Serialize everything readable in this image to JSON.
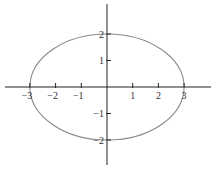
{
  "chart_data": {
    "type": "line",
    "title": "",
    "xlabel": "",
    "ylabel": "",
    "equation": "x^2/9 + y^2/4 = 1",
    "center": [
      0,
      0
    ],
    "semi_axes": {
      "a": 3,
      "b": 2
    },
    "xlim": [
      -4.0,
      4.0
    ],
    "ylim": [
      -3.0,
      3.2
    ],
    "grid": false,
    "legend": null,
    "x_ticks": [
      -3,
      -2,
      -1,
      1,
      2,
      3
    ],
    "x_tick_labels": [
      "−3",
      "−2",
      "−1",
      "1",
      "2",
      "3"
    ],
    "y_ticks": [
      2,
      1,
      -1,
      -2
    ],
    "y_tick_labels": [
      "2",
      "1",
      "−1",
      "−2"
    ],
    "series": [
      {
        "name": "ellipse",
        "color": "#8a8a8a",
        "points": [
          [
            3,
            0
          ],
          [
            2.598,
            1
          ],
          [
            1.5,
            1.732
          ],
          [
            0,
            2
          ],
          [
            -1.5,
            1.732
          ],
          [
            -2.598,
            1
          ],
          [
            -3,
            0
          ],
          [
            -2.598,
            -1
          ],
          [
            -1.5,
            -1.732
          ],
          [
            0,
            -2
          ],
          [
            1.5,
            -1.732
          ],
          [
            2.598,
            -1
          ]
        ]
      }
    ]
  },
  "style": {
    "axis_color": "#222222",
    "curve_color": "#8a8a8a",
    "background": "#ffffff"
  }
}
